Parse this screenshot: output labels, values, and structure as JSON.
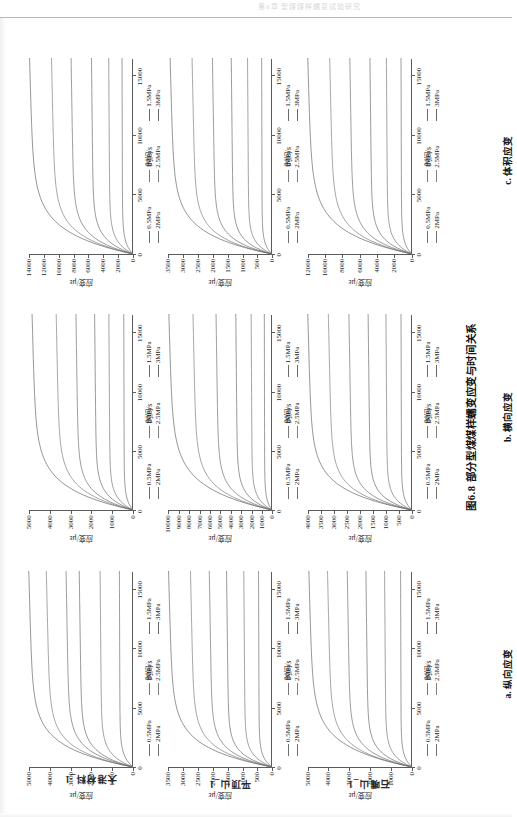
{
  "page": {
    "header_text": "第6章 型煤煤样蠕变试验研究",
    "figure_caption": "图6.8  部分型煤煤样蠕变应变与时间关系"
  },
  "legend": {
    "items": [
      {
        "label": "0.5MPa",
        "color": "#6e6e6e"
      },
      {
        "label": "1MPa",
        "color": "#787878"
      },
      {
        "label": "1.5MPa",
        "color": "#6a6a6a"
      },
      {
        "label": "2MPa",
        "color": "#707070"
      },
      {
        "label": "2.5MPa",
        "color": "#7e7e7e"
      },
      {
        "label": "3MPa",
        "color": "#666666"
      }
    ]
  },
  "axes_common": {
    "xlabel": "时间/s",
    "ylabel": "应变/με",
    "xticks": [
      0,
      5000,
      10000,
      15000
    ],
    "xlim": [
      0,
      16500
    ]
  },
  "columns": [
    {
      "key": "a",
      "caption": "a. 纵向应变"
    },
    {
      "key": "b",
      "caption": "b. 横向应变"
    },
    {
      "key": "c",
      "caption": "c. 体积应变"
    }
  ],
  "rows": [
    {
      "key": "r1",
      "label": "大港材料_1"
    },
    {
      "key": "r2",
      "label": "平顶山_1"
    },
    {
      "key": "r3",
      "label": "石嘴山_1"
    }
  ],
  "chart_data": [
    {
      "id": "r1c1",
      "type": "line",
      "title": "",
      "row": "大港材料_1",
      "column": "a. 纵向应变",
      "xlabel": "时间/s",
      "ylabel": "应变/με",
      "xlim": [
        0,
        16500
      ],
      "ylim": [
        0,
        5000
      ],
      "xticks": [
        0,
        5000,
        10000,
        15000
      ],
      "yticks": [
        0,
        1000,
        2000,
        3000,
        4000,
        5000
      ],
      "grid": false,
      "legend_position": "below",
      "series": [
        {
          "name": "0.5MPa",
          "plateau": 620,
          "tau": 900
        },
        {
          "name": "1MPa",
          "plateau": 1500,
          "tau": 1000
        },
        {
          "name": "1.5MPa",
          "plateau": 2450,
          "tau": 1150
        },
        {
          "name": "2MPa",
          "plateau": 3050,
          "tau": 1250
        },
        {
          "name": "2.5MPa",
          "plateau": 3950,
          "tau": 1400
        },
        {
          "name": "3MPa",
          "plateau": 4750,
          "tau": 1600
        }
      ]
    },
    {
      "id": "r1c2",
      "type": "line",
      "row": "大港材料_1",
      "column": "b. 横向应变",
      "xlabel": "时间/s",
      "ylabel": "应变/με",
      "xlim": [
        0,
        16500
      ],
      "ylim": [
        0,
        5000
      ],
      "xticks": [
        0,
        5000,
        10000,
        15000
      ],
      "yticks": [
        0,
        1000,
        2000,
        3000,
        4000,
        5000
      ],
      "grid": false,
      "legend_position": "below",
      "series": [
        {
          "name": "0.5MPa",
          "plateau": 420,
          "tau": 850
        },
        {
          "name": "1MPa",
          "plateau": 1100,
          "tau": 950
        },
        {
          "name": "1.5MPa",
          "plateau": 1750,
          "tau": 1100
        },
        {
          "name": "2MPa",
          "plateau": 2600,
          "tau": 1250
        },
        {
          "name": "2.5MPa",
          "plateau": 3500,
          "tau": 1500
        },
        {
          "name": "3MPa",
          "plateau": 4600,
          "tau": 1750
        }
      ]
    },
    {
      "id": "r1c3",
      "type": "line",
      "row": "大港材料_1",
      "column": "c. 体积应变",
      "xlabel": "时间/s",
      "ylabel": "应变/με",
      "xlim": [
        0,
        16500
      ],
      "ylim": [
        0,
        14000
      ],
      "xticks": [
        0,
        5000,
        10000,
        15000
      ],
      "yticks": [
        0,
        2000,
        4000,
        6000,
        8000,
        10000,
        12000,
        14000
      ],
      "grid": false,
      "legend_position": "below",
      "series": [
        {
          "name": "0.5MPa",
          "plateau": 1400,
          "tau": 900
        },
        {
          "name": "1MPa",
          "plateau": 3100,
          "tau": 1000
        },
        {
          "name": "1.5MPa",
          "plateau": 5300,
          "tau": 1150
        },
        {
          "name": "2MPa",
          "plateau": 7900,
          "tau": 1300
        },
        {
          "name": "2.5MPa",
          "plateau": 10400,
          "tau": 1500
        },
        {
          "name": "3MPa",
          "plateau": 13200,
          "tau": 1800
        }
      ]
    },
    {
      "id": "r2c1",
      "type": "line",
      "row": "平顶山_1",
      "column": "a. 纵向应变",
      "xlabel": "时间/s",
      "ylabel": "应变/με",
      "xlim": [
        0,
        16500
      ],
      "ylim": [
        0,
        3500
      ],
      "xticks": [
        0,
        5000,
        10000,
        15000
      ],
      "yticks": [
        0,
        500,
        1000,
        1500,
        2000,
        2500,
        3000,
        3500
      ],
      "grid": false,
      "legend_position": "below",
      "series": [
        {
          "name": "0.5MPa",
          "plateau": 430,
          "tau": 800
        },
        {
          "name": "1MPa",
          "plateau": 900,
          "tau": 900
        },
        {
          "name": "1.5MPa",
          "plateau": 1450,
          "tau": 1000
        },
        {
          "name": "2MPa",
          "plateau": 2000,
          "tau": 1150
        },
        {
          "name": "2.5MPa",
          "plateau": 2600,
          "tau": 1350
        },
        {
          "name": "3MPa",
          "plateau": 3300,
          "tau": 1600
        }
      ]
    },
    {
      "id": "r2c2",
      "type": "line",
      "row": "平顶山_1",
      "column": "b. 横向应变",
      "xlabel": "时间/s",
      "ylabel": "应变/με",
      "xlim": [
        0,
        16500
      ],
      "ylim": [
        0,
        10000
      ],
      "xticks": [
        0,
        5000,
        10000,
        15000
      ],
      "yticks": [
        0,
        1000,
        2000,
        3000,
        4000,
        5000,
        6000,
        7000,
        8000,
        9000,
        10000
      ],
      "grid": false,
      "legend_position": "below",
      "series": [
        {
          "name": "0.5MPa",
          "plateau": 700,
          "tau": 800
        },
        {
          "name": "1MPa",
          "plateau": 1900,
          "tau": 900
        },
        {
          "name": "1.5MPa",
          "plateau": 3300,
          "tau": 1050
        },
        {
          "name": "2MPa",
          "plateau": 5100,
          "tau": 1250
        },
        {
          "name": "2.5MPa",
          "plateau": 7200,
          "tau": 1500
        },
        {
          "name": "3MPa",
          "plateau": 9400,
          "tau": 1850
        }
      ]
    },
    {
      "id": "r2c3",
      "type": "line",
      "row": "平顶山_1",
      "column": "c. 体积应变",
      "xlabel": "时间/s",
      "ylabel": "应变/με",
      "xlim": [
        0,
        16500
      ],
      "ylim": [
        0,
        3500
      ],
      "xticks": [
        0,
        5000,
        10000,
        15000
      ],
      "yticks": [
        0,
        500,
        1000,
        1500,
        2000,
        2500,
        3000,
        3500
      ],
      "grid": false,
      "legend_position": "below",
      "series": [
        {
          "name": "0.5MPa",
          "plateau": 330,
          "tau": 780
        },
        {
          "name": "1MPa",
          "plateau": 780,
          "tau": 880
        },
        {
          "name": "1.5MPa",
          "plateau": 1300,
          "tau": 1000
        },
        {
          "name": "2MPa",
          "plateau": 1900,
          "tau": 1150
        },
        {
          "name": "2.5MPa",
          "plateau": 2550,
          "tau": 1350
        },
        {
          "name": "3MPa",
          "plateau": 3250,
          "tau": 1650
        }
      ]
    },
    {
      "id": "r3c1",
      "type": "line",
      "row": "石嘴山_1",
      "column": "a. 纵向应变",
      "xlabel": "时间/s",
      "ylabel": "应变/με",
      "xlim": [
        0,
        16500
      ],
      "ylim": [
        0,
        5000
      ],
      "xticks": [
        0,
        5000,
        10000,
        15000
      ],
      "yticks": [
        0,
        1000,
        2000,
        3000,
        4000,
        5000
      ],
      "grid": false,
      "legend_position": "below",
      "series": [
        {
          "name": "0.5MPa",
          "plateau": 520,
          "tau": 820
        },
        {
          "name": "1MPa",
          "plateau": 1250,
          "tau": 920
        },
        {
          "name": "1.5MPa",
          "plateau": 2100,
          "tau": 1050
        },
        {
          "name": "2MPa",
          "plateau": 2950,
          "tau": 1200
        },
        {
          "name": "2.5MPa",
          "plateau": 3850,
          "tau": 1400
        },
        {
          "name": "3MPa",
          "plateau": 4700,
          "tau": 1700
        }
      ]
    },
    {
      "id": "r3c2",
      "type": "line",
      "row": "石嘴山_1",
      "column": "b. 横向应变",
      "xlabel": "时间/s",
      "ylabel": "应变/με",
      "xlim": [
        0,
        16500
      ],
      "ylim": [
        0,
        4000
      ],
      "xticks": [
        0,
        5000,
        10000,
        15000
      ],
      "yticks": [
        0,
        500,
        1000,
        1500,
        2000,
        2500,
        3000,
        3500,
        4000
      ],
      "grid": false,
      "legend_position": "below",
      "series": [
        {
          "name": "0.5MPa",
          "plateau": 400,
          "tau": 800
        },
        {
          "name": "1MPa",
          "plateau": 950,
          "tau": 900
        },
        {
          "name": "1.5MPa",
          "plateau": 1600,
          "tau": 1000
        },
        {
          "name": "2MPa",
          "plateau": 2300,
          "tau": 1150
        },
        {
          "name": "2.5MPa",
          "plateau": 3050,
          "tau": 1350
        },
        {
          "name": "3MPa",
          "plateau": 3800,
          "tau": 1600
        }
      ]
    },
    {
      "id": "r3c3",
      "type": "line",
      "row": "石嘴山_1",
      "column": "c. 体积应变",
      "xlabel": "时间/s",
      "ylabel": "应变/με",
      "xlim": [
        0,
        16500
      ],
      "ylim": [
        0,
        12000
      ],
      "xticks": [
        0,
        5000,
        10000,
        15000
      ],
      "yticks": [
        0,
        2000,
        4000,
        6000,
        8000,
        10000,
        12000
      ],
      "grid": false,
      "legend_position": "below",
      "series": [
        {
          "name": "0.5MPa",
          "plateau": 1200,
          "tau": 850
        },
        {
          "name": "1MPa",
          "plateau": 2800,
          "tau": 950
        },
        {
          "name": "1.5MPa",
          "plateau": 4600,
          "tau": 1100
        },
        {
          "name": "2MPa",
          "plateau": 6800,
          "tau": 1300
        },
        {
          "name": "2.5MPa",
          "plateau": 9000,
          "tau": 1500
        },
        {
          "name": "3MPa",
          "plateau": 11400,
          "tau": 1800
        }
      ]
    }
  ]
}
